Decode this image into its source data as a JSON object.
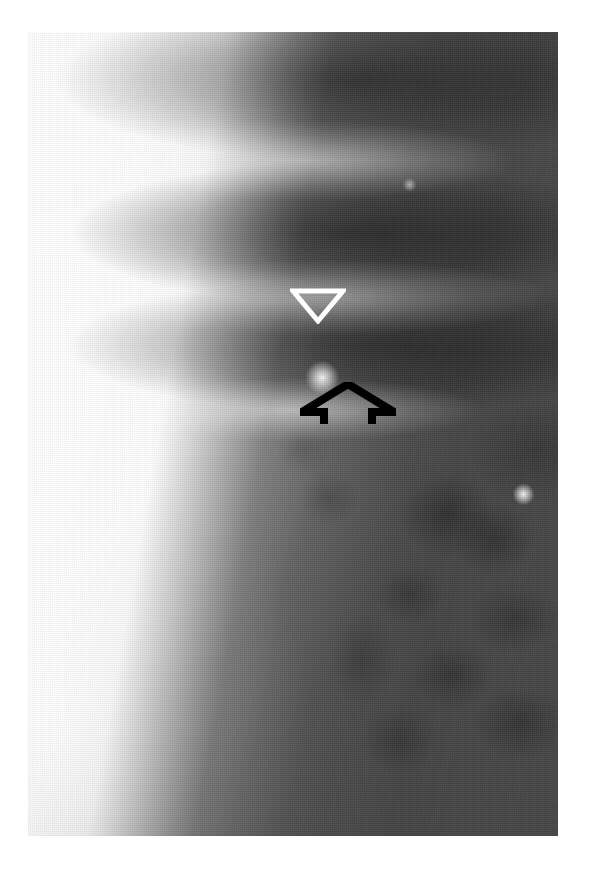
{
  "figure": {
    "kind": "radiograph",
    "modality": "x-ray",
    "view": "lateral spine",
    "plate": {
      "left": 28,
      "top": 32,
      "width": 530,
      "height": 804,
      "background_color": "#9a9a9a",
      "bright_region_color": "#fdfdfd",
      "dark_region_color": "#3c3c3c"
    },
    "page_background_color": "#ffffff"
  },
  "annotations": [
    {
      "id": "arrowhead",
      "glyph": "open-triangle-down",
      "name": "white-arrowhead-marker",
      "color": "#ffffff",
      "stroke_width": 4,
      "x": 290,
      "y": 288,
      "width": 56,
      "height": 36,
      "points_to": "sclerotic lesion at vertebral endplate"
    },
    {
      "id": "arrow",
      "glyph": "open-arrow-up",
      "name": "black-open-arrow-marker",
      "color": "#000000",
      "stroke_width": 7,
      "x": 300,
      "y": 382,
      "width": 96,
      "height": 42,
      "points_to": "lucent defect below endplate"
    }
  ],
  "caption": {
    "text": "",
    "visible_fragment": ""
  }
}
